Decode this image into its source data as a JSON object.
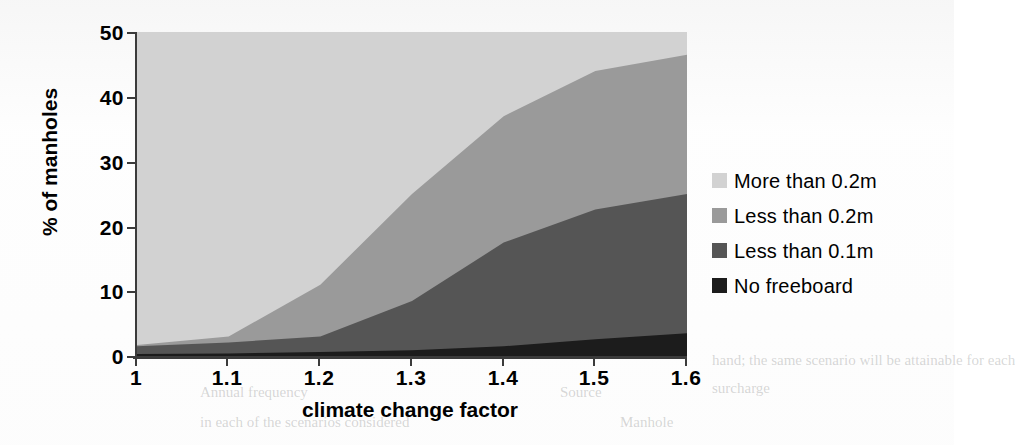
{
  "chart_data": {
    "type": "area",
    "stacked": true,
    "title": "",
    "subtitle": "",
    "xlabel": "climate change factor",
    "ylabel": "% of manholes",
    "x": [
      1,
      1.1,
      1.2,
      1.3,
      1.4,
      1.5,
      1.6
    ],
    "xtick_labels": [
      "1",
      "1.1",
      "1.2",
      "1.3",
      "1.4",
      "1.5",
      "1.6"
    ],
    "ytick_labels": [
      "0",
      "10",
      "20",
      "30",
      "40",
      "50"
    ],
    "yticks": [
      0,
      10,
      20,
      30,
      40,
      50
    ],
    "xlim": [
      1,
      1.6
    ],
    "ylim": [
      0,
      50
    ],
    "grid": false,
    "legend_position": "right",
    "series": [
      {
        "name": "No freeboard",
        "color": "#1c1c1c",
        "values": [
          0.3,
          0.4,
          0.6,
          0.9,
          1.5,
          2.6,
          3.5
        ]
      },
      {
        "name": "Less than 0.1m",
        "color": "#555555",
        "values": [
          1.2,
          1.7,
          2.4,
          7.6,
          16.0,
          20.0,
          21.5
        ]
      },
      {
        "name": "Less than 0.2m",
        "color": "#9a9a9a",
        "values": [
          0.2,
          0.9,
          8.0,
          16.5,
          19.5,
          21.4,
          21.5
        ]
      },
      {
        "name": "More than 0.2m",
        "color": "#d2d2d2",
        "values": [
          48.3,
          47.0,
          39.0,
          25.0,
          13.0,
          6.0,
          3.5
        ]
      }
    ],
    "cumulative_tops": {
      "no_freeboard": [
        0.3,
        0.4,
        0.6,
        0.9,
        1.5,
        2.6,
        3.5
      ],
      "less_than_0_1m": [
        1.5,
        2.1,
        3.0,
        8.5,
        17.5,
        22.6,
        25.0
      ],
      "less_than_0_2m": [
        1.7,
        3.0,
        11.0,
        25.0,
        37.0,
        44.0,
        46.5
      ],
      "more_than_0_2m": [
        50,
        50,
        50,
        50,
        50,
        50,
        50
      ]
    }
  },
  "axes": {
    "x_title": "climate change factor",
    "y_title": "% of manholes",
    "x_ticks": [
      "1",
      "1.1",
      "1.2",
      "1.3",
      "1.4",
      "1.5",
      "1.6"
    ],
    "y_ticks": [
      "50",
      "40",
      "30",
      "20",
      "10",
      "0"
    ]
  },
  "legend": {
    "items": [
      {
        "label": "More than 0.2m",
        "color": "#d2d2d2"
      },
      {
        "label": "Less than 0.2m",
        "color": "#9a9a9a"
      },
      {
        "label": "Less than 0.1m",
        "color": "#555555"
      },
      {
        "label": "No freeboard",
        "color": "#1c1c1c"
      }
    ]
  },
  "colors": {
    "axis": "#3b3b3b",
    "background": "#ffffff",
    "text": "#000000"
  }
}
